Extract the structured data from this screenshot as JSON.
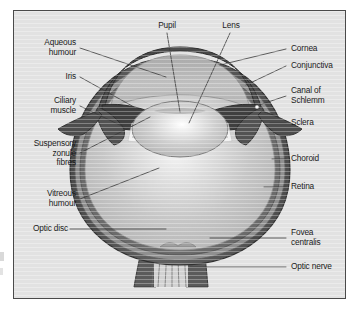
{
  "figure": {
    "type": "anatomical-diagram",
    "panel_background": "#e2e2e2",
    "frame_border": "#4a4a4a",
    "page_background": "#ffffff"
  },
  "labels": {
    "pupil": "Pupil",
    "lens": "Lens",
    "aqueous_humour": "Aqueous\nhumour",
    "iris": "Iris",
    "ciliary_muscle": "Ciliary\nmuscle",
    "suspensory_zonule_fibres": "Suspensory\nzonule\nfibres",
    "vitreous_humour": "Vitreous\nhumour",
    "optic_disc": "Optic disc",
    "cornea": "Cornea",
    "conjunctiva": "Conjunctiva",
    "canal_of_schlemm": "Canal of\nSchlemm",
    "sclera": "Sclera",
    "choroid": "Choroid",
    "retina": "Retina",
    "fovea_centralis": "Fovea\ncentralis",
    "optic_nerve": "Optic nerve"
  },
  "colors": {
    "sclera_outer": "#595959",
    "choroid": "#8c8c8c",
    "retina": "#6e6e6e",
    "vitreous": "#c4c4c4",
    "vitreous_highlight": "#f2f2f2",
    "lens": "#c9c9c9",
    "lens_highlight": "#ffffff",
    "iris_dark": "#4f4f4f",
    "anterior_chamber": "#b5b5b5",
    "zonule_white": "#f4f4f4",
    "leader_line": "#3a3a3a",
    "text": "#1b1b1b"
  }
}
